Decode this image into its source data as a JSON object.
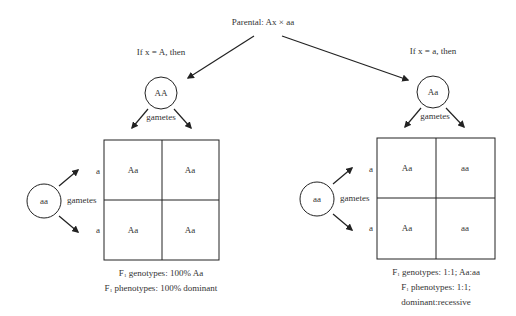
{
  "title": "Parental: Ax × aa",
  "branches": [
    {
      "condition": "If x = A, then",
      "parent_circle": "AA",
      "gametes_label_top": "gametes",
      "other_parent_circle": "aa",
      "gametes_label_side": "gametes",
      "row_alleles": [
        "a",
        "a"
      ],
      "cells": [
        [
          "Aa",
          "Aa"
        ],
        [
          "Aa",
          "Aa"
        ]
      ],
      "genotypes_prefix": "F",
      "genotypes_sub": "1",
      "genotypes_text": " genotypes: 100% Aa",
      "phenotypes_prefix": "F",
      "phenotypes_sub": "1",
      "phenotypes_text": " phenotypes: 100% dominant",
      "phenotypes_line2": ""
    },
    {
      "condition": "If x = a, then",
      "parent_circle": "Aa",
      "gametes_label_top": "gametes",
      "other_parent_circle": "aa",
      "gametes_label_side": "gametes",
      "row_alleles": [
        "a",
        "a"
      ],
      "cells": [
        [
          "Aa",
          "aa"
        ],
        [
          "Aa",
          "aa"
        ]
      ],
      "genotypes_prefix": "F",
      "genotypes_sub": "1",
      "genotypes_text": " genotypes: 1:1; Aa:aa",
      "phenotypes_prefix": "F",
      "phenotypes_sub": "1",
      "phenotypes_text": " phenotypes: 1:1;",
      "phenotypes_line2": "dominant:recessive"
    }
  ],
  "colors": {
    "line": "#222222",
    "text": "#333333",
    "background": "#ffffff"
  }
}
